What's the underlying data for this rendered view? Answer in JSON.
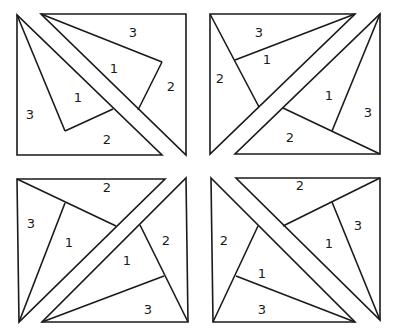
{
  "diagram": {
    "panels": [
      {
        "id": "top-left",
        "labels": [
          {
            "text": "3",
            "x": 133,
            "y": 32
          },
          {
            "text": "1",
            "x": 114,
            "y": 68
          },
          {
            "text": "2",
            "x": 171,
            "y": 86
          },
          {
            "text": "1",
            "x": 78,
            "y": 97
          },
          {
            "text": "3",
            "x": 30,
            "y": 114
          },
          {
            "text": "2",
            "x": 107,
            "y": 139
          }
        ]
      },
      {
        "id": "top-right",
        "labels": [
          {
            "text": "3",
            "x": 259,
            "y": 32
          },
          {
            "text": "1",
            "x": 267,
            "y": 59
          },
          {
            "text": "2",
            "x": 220,
            "y": 78
          },
          {
            "text": "1",
            "x": 329,
            "y": 95
          },
          {
            "text": "3",
            "x": 368,
            "y": 112
          },
          {
            "text": "2",
            "x": 290,
            "y": 137
          }
        ]
      },
      {
        "id": "bottom-left",
        "labels": [
          {
            "text": "2",
            "x": 107,
            "y": 187
          },
          {
            "text": "3",
            "x": 31,
            "y": 223
          },
          {
            "text": "1",
            "x": 69,
            "y": 242
          },
          {
            "text": "2",
            "x": 166,
            "y": 240
          },
          {
            "text": "1",
            "x": 127,
            "y": 260
          },
          {
            "text": "3",
            "x": 148,
            "y": 309
          }
        ]
      },
      {
        "id": "bottom-right",
        "labels": [
          {
            "text": "2",
            "x": 300,
            "y": 185
          },
          {
            "text": "3",
            "x": 358,
            "y": 225
          },
          {
            "text": "2",
            "x": 224,
            "y": 240
          },
          {
            "text": "1",
            "x": 329,
            "y": 243
          },
          {
            "text": "1",
            "x": 262,
            "y": 273
          },
          {
            "text": "3",
            "x": 262,
            "y": 309
          }
        ]
      }
    ]
  }
}
